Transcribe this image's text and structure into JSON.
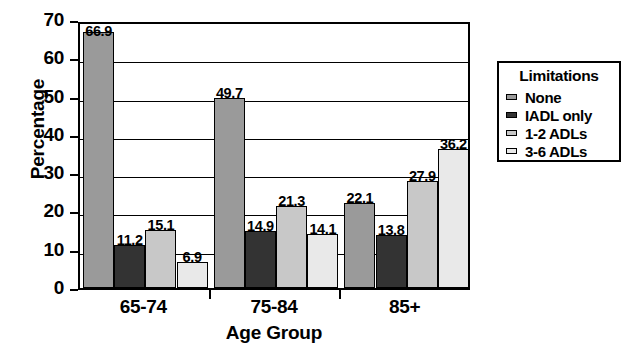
{
  "chart_data": {
    "type": "bar",
    "title": "",
    "xlabel": "Age Group",
    "ylabel": "Percentage",
    "categories": [
      "65-74",
      "75-84",
      "85+"
    ],
    "series": [
      {
        "name": "None",
        "values": [
          66.9,
          49.7,
          22.1
        ],
        "color": "#9a9a9a"
      },
      {
        "name": "IADL only",
        "values": [
          11.2,
          14.9,
          13.8
        ],
        "color": "#333333"
      },
      {
        "name": "1-2 ADLs",
        "values": [
          15.1,
          21.3,
          27.9
        ],
        "color": "#c8c8c8"
      },
      {
        "name": "3-6 ADLs",
        "values": [
          6.9,
          14.1,
          36.2
        ],
        "color": "#e9e9e9"
      }
    ],
    "ylim": [
      0,
      70
    ],
    "yticks": [
      0,
      10,
      20,
      30,
      40,
      50,
      60,
      70
    ],
    "ytick_labels": [
      "0",
      "10",
      "20",
      "30",
      "40",
      "50",
      "60",
      "70"
    ],
    "grid": true,
    "grid_axis": "y",
    "legend_position": "right-outside",
    "data_labels": [
      [
        "66.9",
        "11.2",
        "15.1",
        "6.9"
      ],
      [
        "49.7",
        "14.9",
        "21.3",
        "14.1"
      ],
      [
        "22.1",
        "13.8",
        "27.9",
        "36.2"
      ]
    ]
  },
  "legend": {
    "title": "Limitations",
    "entries": [
      {
        "label": "None"
      },
      {
        "label": "IADL only"
      },
      {
        "label": "1-2 ADLs"
      },
      {
        "label": "3-6 ADLs"
      }
    ]
  }
}
